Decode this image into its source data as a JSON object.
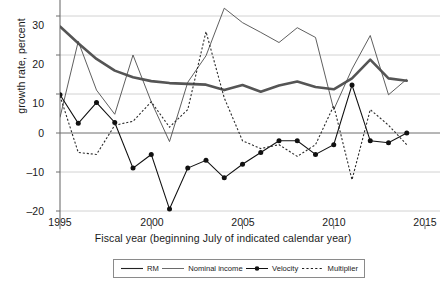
{
  "chart_data": {
    "type": "line",
    "title": "",
    "xlabel": "Fiscal year (beginning July of indicated calendar year)",
    "ylabel": "growth rate, percent",
    "xlim": [
      1994.3,
      2014.9
    ],
    "ylim": [
      -23.5,
      34.5
    ],
    "xticks": [
      1995,
      2000,
      2005,
      2010,
      2015
    ],
    "xticklabels": [
      "1995",
      "2000",
      "2005",
      "2010",
      "2015"
    ],
    "yticks": [
      -20,
      -10,
      0,
      10,
      20,
      30
    ],
    "yticklabels": [
      "–20",
      "–10",
      "0",
      "10",
      "20",
      "30"
    ],
    "grid": true,
    "grid_axis": "y",
    "legend_position": "bottom-center",
    "x": [
      1995,
      1996,
      1997,
      1998,
      1999,
      2000,
      2001,
      2002,
      2003,
      2004,
      2005,
      2006,
      2007,
      2008,
      2009,
      2010,
      2011,
      2012,
      2013,
      2014
    ],
    "series": [
      {
        "name": "RM",
        "style": "solid-thick",
        "color": "#555555",
        "values": [
          27.3,
          23.0,
          19.0,
          16.0,
          14.3,
          13.3,
          12.8,
          12.6,
          12.4,
          11.0,
          12.3,
          10.6,
          12.2,
          13.2,
          11.8,
          11.2,
          14.0,
          18.8,
          14.0,
          13.4
        ]
      },
      {
        "name": "Nominal income",
        "style": "solid-thin",
        "color": "#4d4d4d",
        "values": [
          4.0,
          23.5,
          11.0,
          4.8,
          20.0,
          8.0,
          -2.2,
          13.0,
          19.8,
          32.0,
          28.3,
          25.8,
          23.2,
          27.0,
          24.5,
          6.0,
          16.4,
          25.0,
          9.8,
          13.8
        ]
      },
      {
        "name": "Velocity",
        "style": "solid-marker",
        "color": "#111111",
        "values": [
          9.8,
          2.5,
          7.8,
          2.7,
          -9.0,
          -5.5,
          -19.5,
          -9.0,
          -7.0,
          -11.5,
          -8.0,
          -5.0,
          -2.0,
          -2.0,
          -5.5,
          -3.0,
          12.3,
          -2.0,
          -2.5,
          0.0
        ]
      },
      {
        "name": "Multiplier",
        "style": "dotted",
        "color": "#2b2b2b",
        "values": [
          9.5,
          -5.0,
          -5.5,
          2.0,
          3.0,
          8.0,
          1.5,
          6.0,
          26.0,
          9.0,
          -2.0,
          -4.0,
          -3.0,
          -6.0,
          -3.0,
          7.0,
          -12.0,
          6.0,
          2.0,
          -3.0
        ]
      }
    ]
  },
  "legend": {
    "items": [
      {
        "label": "RM",
        "swatch": "line-thick-dark"
      },
      {
        "label": "Nominal income",
        "swatch": "line-thin"
      },
      {
        "label": "Velocity",
        "swatch": "line-marker"
      },
      {
        "label": "Multiplier",
        "swatch": "line-dotted"
      }
    ]
  }
}
